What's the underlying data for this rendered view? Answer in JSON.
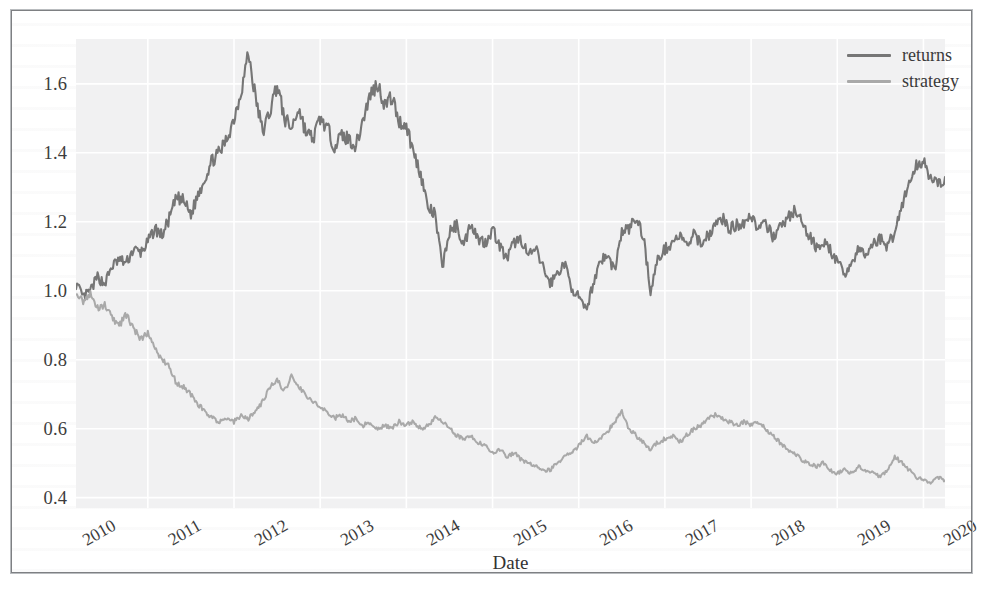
{
  "figure": {
    "background_color": "#ffffff",
    "plot_background_color": "#f1f1f2",
    "grid_color": "#ffffff",
    "frame_color": "#7e8083"
  },
  "legend": {
    "position": "upper-right",
    "items": [
      {
        "label": "returns",
        "color": "#767676"
      },
      {
        "label": "strategy",
        "color": "#a9a9a9"
      }
    ]
  },
  "axis": {
    "xlabel": "Date",
    "ylabel": "",
    "yticks": [
      "0.4",
      "0.6",
      "0.8",
      "1.0",
      "1.2",
      "1.4",
      "1.6"
    ],
    "xticks": [
      "2010",
      "2011",
      "2012",
      "2013",
      "2014",
      "2015",
      "2016",
      "2017",
      "2018",
      "2019",
      "2020"
    ]
  },
  "chart_data": {
    "type": "line",
    "title": "",
    "xlabel": "Date",
    "ylabel": "",
    "xlim": [
      "2010-03",
      "2020-04"
    ],
    "ylim": [
      0.37,
      1.73
    ],
    "yticks": [
      0.4,
      0.6,
      0.8,
      1.0,
      1.2,
      1.4,
      1.6
    ],
    "xticks": [
      "2010",
      "2011",
      "2012",
      "2013",
      "2014",
      "2015",
      "2016",
      "2017",
      "2018",
      "2019",
      "2020"
    ],
    "grid": true,
    "legend_position": "upper right",
    "x_is_time": true,
    "series": [
      {
        "name": "returns",
        "color": "#767676",
        "x": [
          "2010-03",
          "2010-04",
          "2010-05",
          "2010-06",
          "2010-07",
          "2010-08",
          "2010-09",
          "2010-10",
          "2010-11",
          "2010-12",
          "2011-01",
          "2011-02",
          "2011-03",
          "2011-04",
          "2011-05",
          "2011-06",
          "2011-07",
          "2011-08",
          "2011-09",
          "2011-10",
          "2011-11",
          "2011-12",
          "2012-01",
          "2012-02",
          "2012-03",
          "2012-04",
          "2012-05",
          "2012-06",
          "2012-07",
          "2012-08",
          "2012-09",
          "2012-10",
          "2012-11",
          "2012-12",
          "2013-01",
          "2013-02",
          "2013-03",
          "2013-04",
          "2013-05",
          "2013-06",
          "2013-07",
          "2013-08",
          "2013-09",
          "2013-10",
          "2013-11",
          "2013-12",
          "2014-01",
          "2014-02",
          "2014-03",
          "2014-04",
          "2014-05",
          "2014-06",
          "2014-07",
          "2014-08",
          "2014-09",
          "2014-10",
          "2014-11",
          "2014-12",
          "2015-01",
          "2015-02",
          "2015-03",
          "2015-04",
          "2015-05",
          "2015-06",
          "2015-07",
          "2015-08",
          "2015-09",
          "2015-10",
          "2015-11",
          "2015-12",
          "2016-01",
          "2016-02",
          "2016-03",
          "2016-04",
          "2016-05",
          "2016-06",
          "2016-07",
          "2016-08",
          "2016-09",
          "2016-10",
          "2016-11",
          "2016-12",
          "2017-01",
          "2017-02",
          "2017-03",
          "2017-04",
          "2017-05",
          "2017-06",
          "2017-07",
          "2017-08",
          "2017-09",
          "2017-10",
          "2017-11",
          "2017-12",
          "2018-01",
          "2018-02",
          "2018-03",
          "2018-04",
          "2018-05",
          "2018-06",
          "2018-07",
          "2018-08",
          "2018-09",
          "2018-10",
          "2018-11",
          "2018-12",
          "2019-01",
          "2019-02",
          "2019-03",
          "2019-04",
          "2019-05",
          "2019-06",
          "2019-07",
          "2019-08",
          "2019-09",
          "2019-10",
          "2019-11",
          "2019-12",
          "2020-01",
          "2020-02",
          "2020-03",
          "2020-04"
        ],
        "values": [
          1.02,
          0.98,
          1.0,
          1.04,
          1.02,
          1.07,
          1.09,
          1.08,
          1.12,
          1.11,
          1.14,
          1.18,
          1.16,
          1.21,
          1.27,
          1.26,
          1.22,
          1.28,
          1.33,
          1.38,
          1.4,
          1.44,
          1.5,
          1.58,
          1.69,
          1.56,
          1.46,
          1.52,
          1.6,
          1.5,
          1.47,
          1.53,
          1.46,
          1.44,
          1.5,
          1.47,
          1.42,
          1.45,
          1.44,
          1.42,
          1.5,
          1.57,
          1.6,
          1.54,
          1.56,
          1.49,
          1.48,
          1.4,
          1.34,
          1.24,
          1.22,
          1.07,
          1.17,
          1.19,
          1.13,
          1.2,
          1.15,
          1.14,
          1.18,
          1.13,
          1.09,
          1.14,
          1.15,
          1.1,
          1.12,
          1.07,
          1.02,
          1.05,
          1.08,
          1.01,
          0.98,
          0.94,
          1.02,
          1.09,
          1.1,
          1.06,
          1.17,
          1.18,
          1.21,
          1.16,
          1.0,
          1.09,
          1.12,
          1.14,
          1.16,
          1.13,
          1.16,
          1.14,
          1.16,
          1.19,
          1.21,
          1.18,
          1.19,
          1.2,
          1.22,
          1.18,
          1.19,
          1.16,
          1.18,
          1.21,
          1.23,
          1.2,
          1.16,
          1.13,
          1.14,
          1.12,
          1.08,
          1.05,
          1.08,
          1.12,
          1.1,
          1.14,
          1.15,
          1.13,
          1.17,
          1.25,
          1.31,
          1.36,
          1.38,
          1.33,
          1.3,
          1.33
        ]
      },
      {
        "name": "strategy",
        "color": "#a9a9a9",
        "x": [
          "2010-03",
          "2010-04",
          "2010-05",
          "2010-06",
          "2010-07",
          "2010-08",
          "2010-09",
          "2010-10",
          "2010-11",
          "2010-12",
          "2011-01",
          "2011-02",
          "2011-03",
          "2011-04",
          "2011-05",
          "2011-06",
          "2011-07",
          "2011-08",
          "2011-09",
          "2011-10",
          "2011-11",
          "2011-12",
          "2012-01",
          "2012-02",
          "2012-03",
          "2012-04",
          "2012-05",
          "2012-06",
          "2012-07",
          "2012-08",
          "2012-09",
          "2012-10",
          "2012-11",
          "2012-12",
          "2013-01",
          "2013-02",
          "2013-03",
          "2013-04",
          "2013-05",
          "2013-06",
          "2013-07",
          "2013-08",
          "2013-09",
          "2013-10",
          "2013-11",
          "2013-12",
          "2014-01",
          "2014-02",
          "2014-03",
          "2014-04",
          "2014-05",
          "2014-06",
          "2014-07",
          "2014-08",
          "2014-09",
          "2014-10",
          "2014-11",
          "2014-12",
          "2015-01",
          "2015-02",
          "2015-03",
          "2015-04",
          "2015-05",
          "2015-06",
          "2015-07",
          "2015-08",
          "2015-09",
          "2015-10",
          "2015-11",
          "2015-12",
          "2016-01",
          "2016-02",
          "2016-03",
          "2016-04",
          "2016-05",
          "2016-06",
          "2016-07",
          "2016-08",
          "2016-09",
          "2016-10",
          "2016-11",
          "2016-12",
          "2017-01",
          "2017-02",
          "2017-03",
          "2017-04",
          "2017-05",
          "2017-06",
          "2017-07",
          "2017-08",
          "2017-09",
          "2017-10",
          "2017-11",
          "2017-12",
          "2018-01",
          "2018-02",
          "2018-03",
          "2018-04",
          "2018-05",
          "2018-06",
          "2018-07",
          "2018-08",
          "2018-09",
          "2018-10",
          "2018-11",
          "2018-12",
          "2019-01",
          "2019-02",
          "2019-03",
          "2019-04",
          "2019-05",
          "2019-06",
          "2019-07",
          "2019-08",
          "2019-09",
          "2019-10",
          "2019-11",
          "2019-12",
          "2020-01",
          "2020-02",
          "2020-03",
          "2020-04"
        ],
        "values": [
          1.0,
          0.97,
          0.99,
          0.95,
          0.96,
          0.92,
          0.9,
          0.93,
          0.89,
          0.86,
          0.88,
          0.83,
          0.8,
          0.78,
          0.73,
          0.72,
          0.7,
          0.67,
          0.65,
          0.63,
          0.62,
          0.63,
          0.62,
          0.64,
          0.63,
          0.65,
          0.68,
          0.72,
          0.74,
          0.71,
          0.75,
          0.72,
          0.7,
          0.68,
          0.66,
          0.65,
          0.63,
          0.64,
          0.62,
          0.63,
          0.61,
          0.62,
          0.6,
          0.61,
          0.6,
          0.62,
          0.61,
          0.62,
          0.6,
          0.61,
          0.63,
          0.62,
          0.6,
          0.58,
          0.57,
          0.58,
          0.56,
          0.55,
          0.53,
          0.54,
          0.52,
          0.53,
          0.51,
          0.5,
          0.49,
          0.48,
          0.48,
          0.5,
          0.52,
          0.53,
          0.55,
          0.58,
          0.56,
          0.57,
          0.59,
          0.62,
          0.65,
          0.6,
          0.58,
          0.56,
          0.54,
          0.56,
          0.57,
          0.58,
          0.56,
          0.58,
          0.6,
          0.61,
          0.63,
          0.64,
          0.63,
          0.62,
          0.61,
          0.62,
          0.61,
          0.62,
          0.6,
          0.58,
          0.56,
          0.54,
          0.53,
          0.51,
          0.5,
          0.49,
          0.5,
          0.48,
          0.47,
          0.48,
          0.47,
          0.49,
          0.48,
          0.47,
          0.46,
          0.48,
          0.52,
          0.5,
          0.48,
          0.46,
          0.45,
          0.44,
          0.46,
          0.45
        ]
      }
    ]
  }
}
